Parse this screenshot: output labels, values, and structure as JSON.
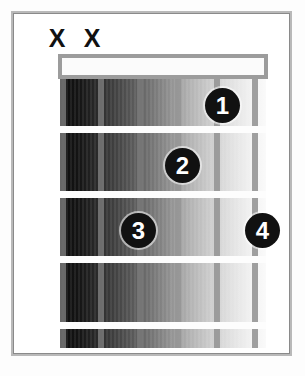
{
  "diagram": {
    "type": "guitar-chord-diagram",
    "frets": 4,
    "strings": 6,
    "nut_shown": true,
    "colors": {
      "dot_fill": "#111111",
      "dot_text": "#ffffff",
      "frame_border": "#8a8a8a",
      "nut_border": "#9c9c9c",
      "fret_line": "#fdfdfd",
      "string_line": "#787878"
    }
  },
  "string_markers": [
    {
      "label": "X",
      "name": "mute-marker-string-6",
      "left": 44
    },
    {
      "label": "X",
      "name": "mute-marker-string-5",
      "left": 79
    }
  ],
  "strings": [
    {
      "name": "string-6",
      "left": 0
    },
    {
      "name": "string-5",
      "left": 38
    },
    {
      "name": "string-4",
      "left": 77
    },
    {
      "name": "string-3",
      "left": 115
    },
    {
      "name": "string-2",
      "left": 154
    },
    {
      "name": "string-1",
      "left": 192
    }
  ],
  "fret_lines": [
    {
      "name": "fret-line-1",
      "top": 47
    },
    {
      "name": "fret-line-2",
      "top": 112
    },
    {
      "name": "fret-line-3",
      "top": 177
    },
    {
      "name": "fret-line-4",
      "top": 243
    }
  ],
  "finger_positions": [
    {
      "finger": "1",
      "string": 2,
      "fret": 1,
      "left": 205,
      "top": 88
    },
    {
      "finger": "2",
      "string": 3,
      "fret": 2,
      "left": 165,
      "top": 148
    },
    {
      "finger": "3",
      "string": 4,
      "fret": 3,
      "left": 121,
      "top": 213
    },
    {
      "finger": "4",
      "string": 1,
      "fret": 3,
      "left": 245,
      "top": 213
    }
  ]
}
